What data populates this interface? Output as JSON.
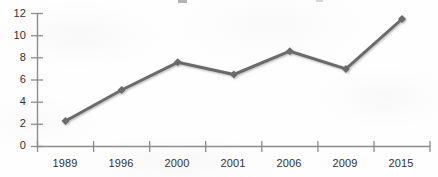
{
  "chart_data": {
    "type": "line",
    "title": "",
    "subtitle": "",
    "xlabel": "",
    "ylabel": "",
    "categories": [
      "1989",
      "1996",
      "2000",
      "2001",
      "2006",
      "2009",
      "2015"
    ],
    "values": [
      2.3,
      5.1,
      7.6,
      6.5,
      8.6,
      7.0,
      11.5
    ],
    "series": [
      {
        "name": "",
        "values": [
          2.3,
          5.1,
          7.6,
          6.5,
          8.6,
          7.0,
          11.5
        ]
      }
    ],
    "ylim": [
      0,
      12
    ],
    "xlim": [
      0,
      7
    ],
    "y_ticks": [
      "0",
      "2",
      "4",
      "6",
      "8",
      "10",
      "12"
    ],
    "y_tick_values": [
      0,
      2,
      4,
      6,
      8,
      10,
      12
    ],
    "x_ticks": [
      "1989",
      "1996",
      "2000",
      "2001",
      "2006",
      "2009",
      "2015"
    ],
    "grid": false,
    "legend": false,
    "legend_position": "none",
    "annotations": [],
    "marker": "diamond",
    "line_color": "#6b6b6b",
    "marker_color": "#6b6b6b",
    "axis_color": "#8c8c8c",
    "label_color": "#2f2f2f",
    "background_color": "#fefefe"
  },
  "axes": {
    "y_axis_name": "value-axis",
    "x_axis_name": "category-axis"
  }
}
